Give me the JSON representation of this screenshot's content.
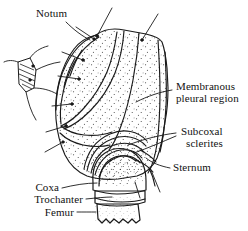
{
  "figure": {
    "kind": "anatomical-line-drawing",
    "background_color": "#ffffff",
    "ink_color": "#1a1a1a",
    "stipple_color": "#2b2b2b",
    "width": 248,
    "height": 231
  },
  "labels": {
    "notum": "Notum",
    "membranous_line1": "Membranous",
    "membranous_line2": "pleural region",
    "subcoxal_line1": "Subcoxal",
    "subcoxal_line2": "sclerites",
    "sternum": "Sternum",
    "coxa": "Coxa",
    "trochanter": "Trochanter",
    "femur": "Femur"
  }
}
